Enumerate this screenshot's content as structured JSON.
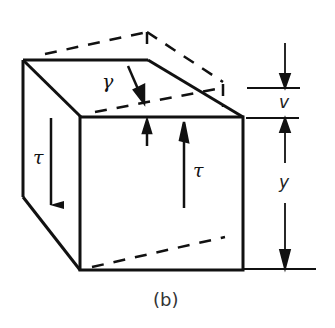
{
  "figure": {
    "caption": "(b)",
    "labels": {
      "tau_left": "τ",
      "tau_right": "τ",
      "gamma": "γ",
      "v": "v",
      "y": "y"
    },
    "colors": {
      "ink": "#111111",
      "background": "#ffffff"
    }
  }
}
